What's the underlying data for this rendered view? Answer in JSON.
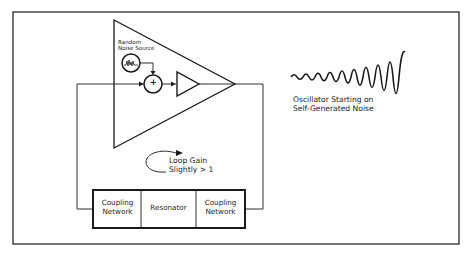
{
  "diagram": {
    "amplifier": {
      "noise_source_label_line1": "Random",
      "noise_source_label_line2": "Noise Source",
      "summing_junction_symbol": "+"
    },
    "loop_annotation": {
      "line1": "Loop Gain",
      "line2": "Slightly > 1"
    },
    "feedback_chain": [
      {
        "line1": "Coupling",
        "line2": "Network"
      },
      {
        "line1": "Resonator",
        "line2": ""
      },
      {
        "line1": "Coupling",
        "line2": "Network"
      }
    ],
    "waveform_caption": {
      "line1": "Oscillator Starting on",
      "line2": "Self-Generated Noise"
    },
    "colors": {
      "stroke": "#1a1a1a",
      "background": "#ffffff"
    }
  }
}
